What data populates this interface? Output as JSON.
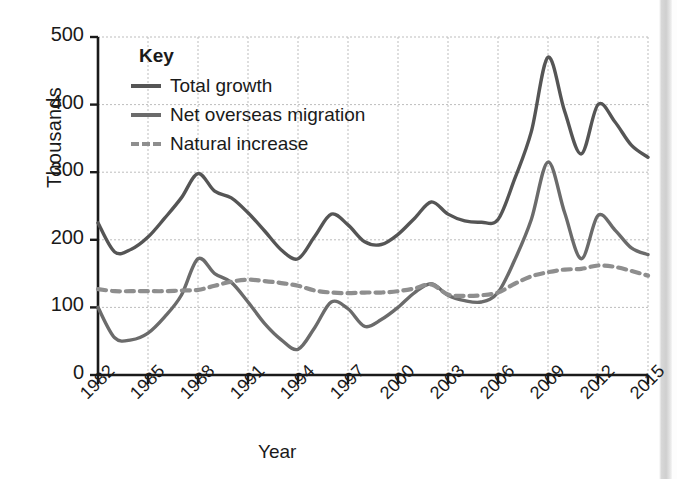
{
  "chart_data": {
    "type": "line",
    "title": "",
    "xlabel": "Year",
    "ylabel": "Thousands",
    "xlim": [
      1982,
      2015
    ],
    "ylim": [
      0,
      500
    ],
    "yticks": [
      0,
      100,
      200,
      300,
      400,
      500
    ],
    "xticks": [
      1982,
      1985,
      1988,
      1991,
      1994,
      1997,
      2000,
      2003,
      2006,
      2009,
      2012,
      2015
    ],
    "grid": true,
    "legend_position": "upper-left",
    "legend_title": "Key",
    "x": [
      1982,
      1983,
      1984,
      1985,
      1986,
      1987,
      1988,
      1989,
      1990,
      1991,
      1992,
      1993,
      1994,
      1995,
      1996,
      1997,
      1998,
      1999,
      2000,
      2001,
      2002,
      2003,
      2004,
      2005,
      2006,
      2007,
      2008,
      2009,
      2010,
      2011,
      2012,
      2013,
      2014,
      2015
    ],
    "series": [
      {
        "name": "Total growth",
        "style": "solid",
        "color": "#555555",
        "values": [
          225,
          182,
          186,
          204,
          232,
          262,
          298,
          272,
          262,
          240,
          213,
          185,
          172,
          205,
          238,
          222,
          197,
          193,
          208,
          232,
          256,
          238,
          228,
          226,
          230,
          290,
          360,
          470,
          390,
          327,
          400,
          375,
          340,
          322
        ]
      },
      {
        "name": "Net overseas migration",
        "style": "solid",
        "color": "#6b6b6b",
        "values": [
          100,
          55,
          52,
          62,
          86,
          118,
          172,
          150,
          137,
          108,
          76,
          52,
          38,
          70,
          108,
          98,
          72,
          82,
          100,
          122,
          135,
          118,
          110,
          108,
          122,
          170,
          230,
          315,
          240,
          172,
          236,
          215,
          188,
          178
        ]
      },
      {
        "name": "Natural increase",
        "style": "dashed",
        "color": "#8e8e8e",
        "values": [
          127,
          124,
          124,
          124,
          124,
          125,
          126,
          132,
          138,
          141,
          139,
          136,
          132,
          125,
          122,
          121,
          122,
          122,
          124,
          128,
          134,
          119,
          117,
          118,
          122,
          135,
          146,
          152,
          156,
          157,
          162,
          160,
          154,
          147
        ]
      }
    ]
  },
  "axis": {
    "ylabel": "Thousands",
    "xlabel": "Year",
    "yticks": [
      "0",
      "100",
      "200",
      "300",
      "400",
      "500"
    ],
    "xticks": [
      "1982",
      "1985",
      "1988",
      "1991",
      "1994",
      "1997",
      "2000",
      "2003",
      "2006",
      "2009",
      "2012",
      "2015"
    ]
  },
  "legend": {
    "title": "Key",
    "items": [
      {
        "label": "Total growth",
        "style": "solid-dark"
      },
      {
        "label": "Net overseas migration",
        "style": "solid-mid"
      },
      {
        "label": "Natural increase",
        "style": "dash"
      }
    ]
  }
}
